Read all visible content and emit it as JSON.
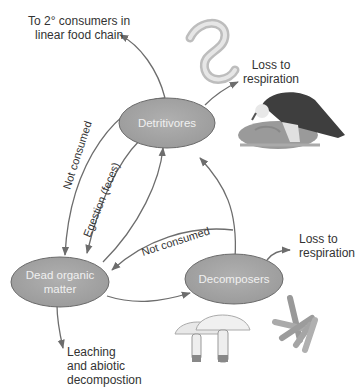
{
  "diagram": {
    "nodes": {
      "detritivores": "Detritivores",
      "dead_organic_matter": [
        "Dead organic",
        "matter"
      ],
      "decomposers": "Decomposers"
    },
    "labels": {
      "to_consumers": [
        "To 2° consumers in",
        "linear food chain"
      ],
      "loss_respiration_1": [
        "Loss to",
        "respiration"
      ],
      "loss_respiration_2": [
        "Loss to",
        "respiration"
      ],
      "leaching": [
        "Leaching",
        "and abiotic",
        "decompostion"
      ]
    },
    "edge_labels": {
      "not_consumed_1": "Not consumed",
      "egestion": "Egestion (feces)",
      "not_consumed_2": "Not consumed"
    },
    "illustrations": [
      "worm",
      "vulture",
      "mushrooms",
      "bacteria"
    ],
    "colors": {
      "node_fill": "#9e9e9e",
      "node_stroke": "#6a6a6a",
      "arrow": "#6d6d6d",
      "text": "#333333"
    }
  }
}
